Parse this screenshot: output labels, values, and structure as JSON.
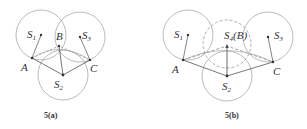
{
  "figures": [
    {
      "caption": "5(a)",
      "nodes": {
        "S1": {
          "label": "S",
          "sub": "1"
        },
        "S2": {
          "label": "S",
          "sub": "2"
        },
        "S3": {
          "label": "S",
          "sub": "3"
        },
        "A": {
          "label": "A"
        },
        "B": {
          "label": "B"
        },
        "C": {
          "label": "C"
        }
      }
    },
    {
      "caption": "5(b)",
      "nodes": {
        "S1": {
          "label": "S",
          "sub": "1"
        },
        "S2": {
          "label": "S",
          "sub": "2"
        },
        "S3": {
          "label": "S",
          "sub": "3"
        },
        "S4": {
          "label": "S",
          "sub": "4",
          "suffix": "(B)"
        },
        "A": {
          "label": "A"
        },
        "C": {
          "label": "C"
        }
      }
    }
  ],
  "colors": {
    "circle": "#999999",
    "line": "#555555",
    "dashed": "#888888",
    "text": "#333333"
  }
}
